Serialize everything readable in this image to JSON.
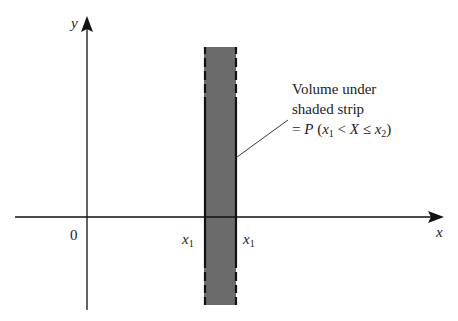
{
  "diagram": {
    "axes": {
      "x_label": "x",
      "y_label": "y",
      "origin_label": "0"
    },
    "strip": {
      "left_label_var": "x",
      "left_label_sub": "1",
      "right_label_var": "x",
      "right_label_sub": "1",
      "fill_color": "#6b6b6b"
    },
    "annotation": {
      "line1": "Volume under",
      "line2": "shaded strip",
      "line3_prefix": "= ",
      "line3_P": "P",
      "line3_open": " (",
      "line3_x1": "x",
      "line3_x1_sub": "1",
      "line3_lt": " < ",
      "line3_X": "X",
      "line3_le": " ≤ ",
      "line3_x2": "x",
      "line3_x2_sub": "2",
      "line3_close": ")"
    }
  }
}
